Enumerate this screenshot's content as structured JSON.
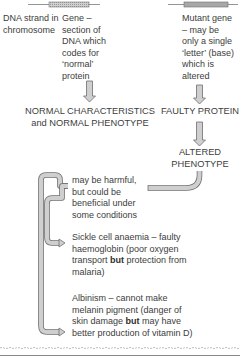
{
  "diagram": {
    "left_column": {
      "dna_label": "DNA strand in chromosome",
      "gene_label": "Gene – section of DNA which codes for ‘normal’ protein",
      "normal_outcome_line1": "NORMAL CHARACTERISTICS",
      "normal_outcome_line2": "and NORMAL PHENOTYPE"
    },
    "right_column": {
      "mutant_label": "Mutant gene – may be only a single ‘letter’ (base) which is altered",
      "faulty_protein": "FAULTY PROTEIN",
      "altered_phenotype_line1": "ALTERED",
      "altered_phenotype_line2": "PHENOTYPE"
    },
    "effects": {
      "summary": "may be harmful, but could be beneficial under some conditions",
      "examples": [
        {
          "pre": "Sickle cell anaemia – faulty haemoglobin (poor oxygen transport ",
          "bold": "but",
          "post": " protection from malaria)"
        },
        {
          "pre": "Albinism – cannot make melanin pigment (danger of skin damage ",
          "bold": "but",
          "post": " may have better production of vitamin D)"
        }
      ]
    },
    "colors": {
      "arrow_fill": "#c8c8c8",
      "arrow_stroke": "#6e6e6e",
      "text": "#3d3d3d"
    }
  }
}
